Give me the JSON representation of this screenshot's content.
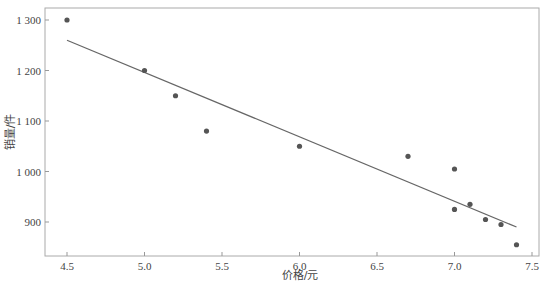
{
  "chart_data": {
    "type": "scatter",
    "title": "",
    "xlabel": "价格/元",
    "ylabel": "销量/件",
    "xlim": [
      4.35,
      7.55
    ],
    "ylim": [
      830,
      1325
    ],
    "xticks": [
      4.5,
      5.0,
      5.5,
      6.0,
      6.5,
      7.0,
      7.5
    ],
    "xtick_labels": [
      "4.5",
      "5.0",
      "5.5",
      "6.0",
      "6.5",
      "7.0",
      "7.5"
    ],
    "yticks": [
      900,
      1000,
      1100,
      1200,
      1300
    ],
    "ytick_labels": [
      "900",
      "1 000",
      "1 100",
      "1 200",
      "1 300"
    ],
    "grid": false,
    "legend": null,
    "series": [
      {
        "name": "观测值",
        "kind": "scatter",
        "x": [
          4.5,
          5.0,
          5.2,
          5.4,
          6.0,
          6.7,
          7.0,
          7.0,
          7.1,
          7.2,
          7.3,
          7.4
        ],
        "y": [
          1300,
          1200,
          1150,
          1080,
          1050,
          1030,
          1005,
          925,
          935,
          905,
          895,
          855
        ],
        "color": "#555555"
      },
      {
        "name": "回归直线",
        "kind": "line",
        "x": [
          4.5,
          7.4
        ],
        "y": [
          1260,
          890
        ],
        "color": "#666666"
      }
    ]
  }
}
